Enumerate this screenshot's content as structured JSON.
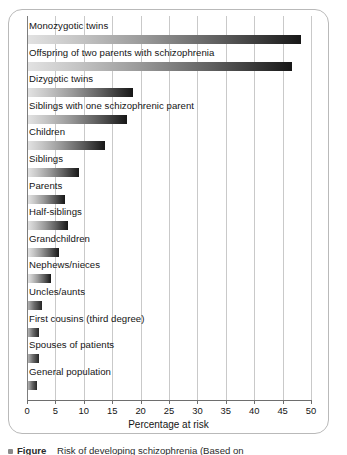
{
  "chart_data": {
    "type": "bar",
    "orientation": "horizontal",
    "title": "",
    "xlabel": "Percentage at risk",
    "ylabel": "",
    "xlim": [
      0,
      50
    ],
    "xticks": [
      0,
      5,
      10,
      15,
      20,
      25,
      30,
      35,
      40,
      45,
      50
    ],
    "grid": "vertical",
    "legend": "none",
    "categories": [
      "Monozygotic twins",
      "Offspring of two parents with schizophrenia",
      "Dizygotic twins",
      "Siblings with one schizophrenic parent",
      "Children",
      "Siblings",
      "Parents",
      "Half-siblings",
      "Grandchildren",
      "Nephews/nieces",
      "Uncles/aunts",
      "First cousins (third degree)",
      "Spouses of patients",
      "General population"
    ],
    "values": [
      48,
      46.5,
      18.5,
      17.5,
      13.5,
      9,
      6.5,
      7,
      5.5,
      4,
      2.5,
      2,
      2,
      1.5
    ],
    "series": [
      {
        "name": "Percentage at risk",
        "values": [
          48,
          46.5,
          18.5,
          17.5,
          13.5,
          9,
          6.5,
          7,
          5.5,
          4,
          2.5,
          2,
          2,
          1.5
        ]
      }
    ]
  },
  "axis": {
    "x_title": "Percentage at risk",
    "tick_labels": [
      "0",
      "5",
      "10",
      "15",
      "20",
      "25",
      "30",
      "35",
      "40",
      "45",
      "50"
    ]
  },
  "caption": {
    "bullet": "",
    "label": "Figure",
    "text": "Risk of developing schizophrenia (Based on"
  },
  "colors": {
    "card_border": "#b9b9b9",
    "gridline": "#c9c9c9",
    "axis": "#6e6e6e",
    "bar_light": "#e2e2e2",
    "bar_dark": "#171717",
    "text": "#141414",
    "background": "#ffffff"
  }
}
